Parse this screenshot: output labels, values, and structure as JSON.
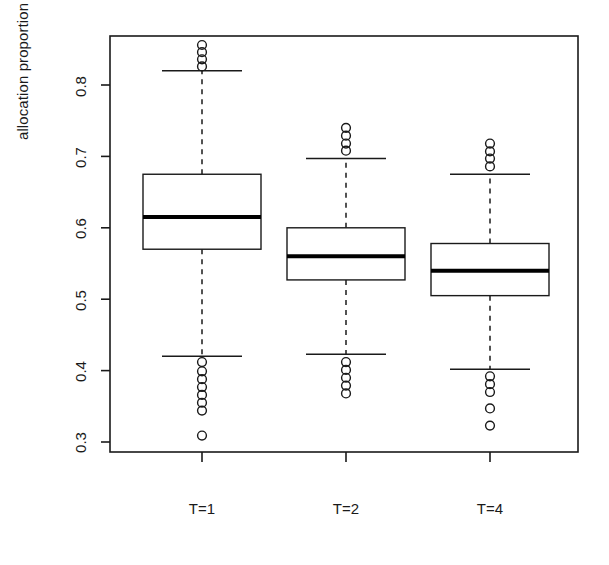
{
  "chart_data": {
    "type": "box",
    "title": "",
    "xlabel": "",
    "ylabel": "allocation proportion",
    "ylim": [
      0.29,
      0.875
    ],
    "yticks": [
      0.3,
      0.4,
      0.5,
      0.6,
      0.7,
      0.8
    ],
    "ytick_labels": [
      "0.3",
      "0.4",
      "0.5",
      "0.6",
      "0.7",
      "0.8"
    ],
    "categories": [
      "T=1",
      "T=2",
      "T=4"
    ],
    "xtick_labels": [
      "T=1",
      "T=2",
      "T=4"
    ],
    "grid": false,
    "legend": "none",
    "box_color": "#ffffff",
    "line_color": "#1a1a1a",
    "median_color": "#000000",
    "boxes": [
      {
        "category": "T=1",
        "whisker_low": 0.42,
        "q1": 0.57,
        "median": 0.615,
        "q3": 0.675,
        "whisker_high": 0.82,
        "outliers_high": [
          0.826,
          0.836,
          0.846,
          0.856
        ],
        "outliers_low": [
          0.412,
          0.399,
          0.388,
          0.377,
          0.366,
          0.355,
          0.344,
          0.309
        ]
      },
      {
        "category": "T=2",
        "whisker_low": 0.423,
        "q1": 0.527,
        "median": 0.56,
        "q3": 0.6,
        "whisker_high": 0.697,
        "outliers_high": [
          0.708,
          0.718,
          0.729,
          0.74
        ],
        "outliers_low": [
          0.412,
          0.401,
          0.39,
          0.379,
          0.368
        ]
      },
      {
        "category": "T=4",
        "whisker_low": 0.402,
        "q1": 0.505,
        "median": 0.54,
        "q3": 0.578,
        "whisker_high": 0.675,
        "outliers_high": [
          0.686,
          0.697,
          0.707,
          0.718
        ],
        "outliers_low": [
          0.392,
          0.381,
          0.37,
          0.347,
          0.323
        ]
      }
    ]
  },
  "axis": {
    "y_title": "allocation proportion",
    "y_tick_0": "0.3",
    "y_tick_1": "0.4",
    "y_tick_2": "0.5",
    "y_tick_3": "0.6",
    "y_tick_4": "0.7",
    "y_tick_5": "0.8",
    "x_tick_0": "T=1",
    "x_tick_1": "T=2",
    "x_tick_2": "T=4"
  }
}
